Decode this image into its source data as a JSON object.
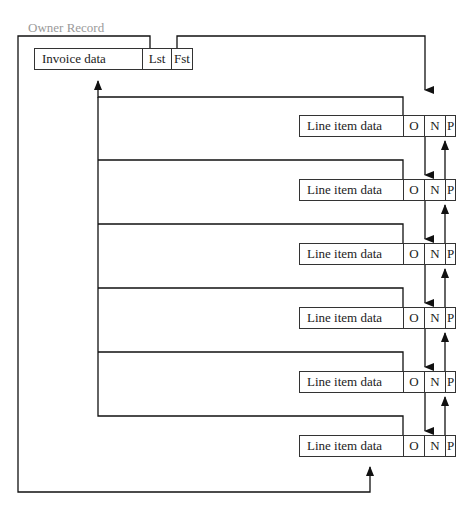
{
  "caption": "Owner Record",
  "owner": {
    "label": "Invoice data",
    "lst": "Lst",
    "fst": "Fst"
  },
  "line_items": [
    {
      "label": "Line item data",
      "o": "O",
      "n": "N",
      "p": "P"
    },
    {
      "label": "Line item data",
      "o": "O",
      "n": "N",
      "p": "P"
    },
    {
      "label": "Line item data",
      "o": "O",
      "n": "N",
      "p": "P"
    },
    {
      "label": "Line item data",
      "o": "O",
      "n": "N",
      "p": "P"
    },
    {
      "label": "Line item data",
      "o": "O",
      "n": "N",
      "p": "P"
    },
    {
      "label": "Line item data",
      "o": "O",
      "n": "N",
      "p": "P"
    }
  ]
}
